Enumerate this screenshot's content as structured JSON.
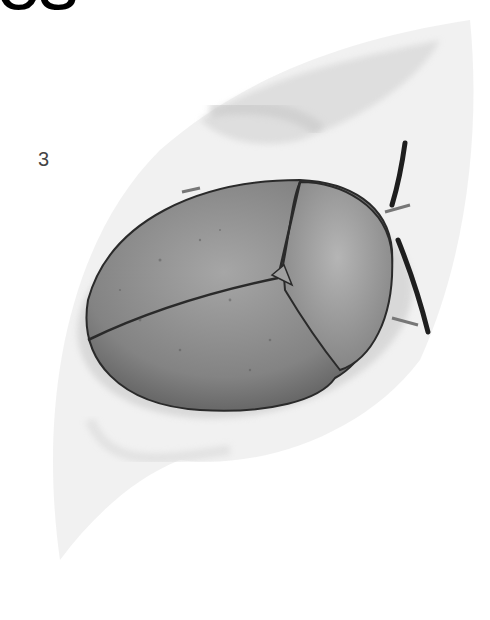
{
  "page": {
    "title_fragment": "es",
    "figure_number": "3"
  },
  "illustration": {
    "subject": "tortoise-beetle-on-leaf",
    "colors": {
      "leaf": "#e6e6e6",
      "leaf_shadow": "#cfcfcf",
      "elytra": "#8a8a8a",
      "pronotum": "#9c9c9c",
      "outline": "#2a2a2a",
      "antenna": "#1e1e1e"
    }
  }
}
